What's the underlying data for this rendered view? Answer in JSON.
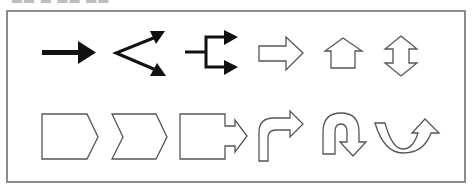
{
  "header": {
    "cut_off_text": "▬▬  ▬   ▬▬ ▬▬"
  },
  "colors": {
    "frame": "#8c8c8c",
    "solid_arrow": "#111111",
    "outline_stroke": "#555555",
    "background": "#ffffff"
  },
  "shapes": {
    "row1": [
      {
        "name": "solid-right-arrow",
        "style": "solid"
      },
      {
        "name": "diverging-arrows",
        "style": "line"
      },
      {
        "name": "branching-arrows",
        "style": "line"
      },
      {
        "name": "block-right-arrow",
        "style": "outline"
      },
      {
        "name": "block-up-arrow",
        "style": "outline"
      },
      {
        "name": "block-up-down-arrow",
        "style": "outline"
      }
    ],
    "row2": [
      {
        "name": "pentagon-arrow",
        "style": "outline"
      },
      {
        "name": "chevron-arrow",
        "style": "outline"
      },
      {
        "name": "callout-right-arrow",
        "style": "outline"
      },
      {
        "name": "bent-arrow",
        "style": "outline"
      },
      {
        "name": "u-turn-arrow",
        "style": "outline"
      },
      {
        "name": "curved-up-arrow",
        "style": "outline"
      }
    ]
  }
}
